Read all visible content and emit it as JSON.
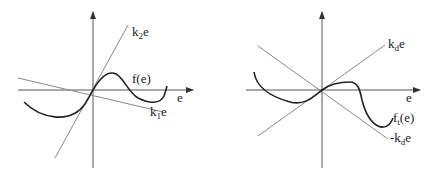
{
  "panels": [
    {
      "id": "left",
      "labels": {
        "line_upper": {
          "base": "k",
          "sub": "2",
          "tail": "e"
        },
        "curve": "f(e)",
        "x_axis": "e",
        "line_lower": {
          "base": "k",
          "sub": "1",
          "tail": "e"
        }
      }
    },
    {
      "id": "right",
      "labels": {
        "line_upper": {
          "base": "k",
          "sub": "d",
          "tail": "e"
        },
        "x_axis": "e",
        "curve": {
          "base": "f",
          "sub": "t",
          "tail": "(e)"
        },
        "line_lower": {
          "prefix": "-",
          "base": "k",
          "sub": "d",
          "tail": "e"
        }
      }
    }
  ],
  "colors": {
    "axis": "#555555",
    "line": "#888888",
    "curve": "#222222"
  }
}
